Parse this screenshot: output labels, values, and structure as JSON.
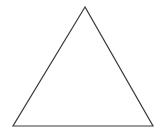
{
  "figure": {
    "shape_name": "triangle",
    "background_color": "#ffffff",
    "stroke_color": "#3a3a3a",
    "stroke_width": 1.2,
    "fill": "none",
    "canvas": {
      "width": 166,
      "height": 137
    },
    "vertices": [
      {
        "label": "apex",
        "x": 85,
        "y": 7
      },
      {
        "label": "bottom-left",
        "x": 13,
        "y": 126
      },
      {
        "label": "bottom-right",
        "x": 153,
        "y": 126
      }
    ],
    "polygon_points": "85,7 13,126 153,126",
    "edges": [
      {
        "name": "left-edge",
        "from": "apex",
        "to": "bottom-left"
      },
      {
        "name": "base-edge",
        "from": "bottom-left",
        "to": "bottom-right"
      },
      {
        "name": "right-edge",
        "from": "bottom-right",
        "to": "apex"
      }
    ]
  }
}
